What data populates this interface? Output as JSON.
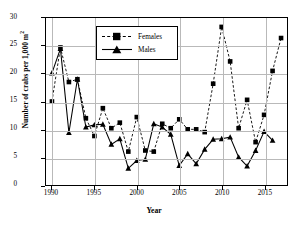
{
  "chart_data": {
    "type": "line",
    "title": "",
    "xlabel": "Year",
    "ylabel": "Number of crabs per 1,000 m²",
    "xlim": [
      1989.3,
      2017.7
    ],
    "ylim": [
      0,
      30
    ],
    "xticks": [
      1990,
      1995,
      2000,
      2005,
      2010,
      2015
    ],
    "yticks": [
      0,
      5,
      10,
      15,
      20,
      25,
      30
    ],
    "grid": true,
    "legend_position": "upper-center-left",
    "x": [
      1990,
      1991,
      1992,
      1993,
      1994,
      1995,
      1996,
      1997,
      1998,
      1999,
      2000,
      2001,
      2002,
      2003,
      2004,
      2005,
      2006,
      2007,
      2008,
      2009,
      2010,
      2011,
      2012,
      2013,
      2014,
      2015,
      2016,
      2017
    ],
    "series": [
      {
        "name": "Females",
        "marker": "square",
        "line_style": "dashed",
        "color": "#000000",
        "values": [
          15.0,
          24.7,
          18.5,
          19.0,
          12.0,
          8.8,
          13.8,
          10.2,
          11.2,
          6.0,
          12.2,
          6.2,
          6.0,
          11.0,
          10.2,
          11.8,
          10.0,
          10.0,
          9.5,
          18.2,
          28.4,
          22.2,
          10.2,
          15.3,
          7.7,
          12.6,
          20.5,
          26.4
        ]
      },
      {
        "name": "Males",
        "marker": "triangle",
        "line_style": "solid",
        "color": "#000000",
        "values": [
          20.1,
          24.5,
          9.4,
          19.0,
          10.4,
          10.8,
          10.9,
          7.3,
          8.3,
          3.0,
          4.4,
          4.6,
          11.0,
          10.4,
          9.1,
          3.5,
          5.6,
          3.8,
          6.4,
          8.2,
          8.3,
          8.6,
          5.0,
          3.4,
          6.2,
          9.6,
          8.0,
          null
        ]
      }
    ]
  },
  "axis": {
    "ytick_labels": [
      "30",
      "25",
      "20",
      "15",
      "10",
      "5",
      "0"
    ],
    "xtick_labels": [
      "1990",
      "1995",
      "2000",
      "2005",
      "2010",
      "2015"
    ],
    "ytitle_main": "Number of crabs per 1,000 m",
    "ytitle_sup": "2",
    "xtitle": "Year"
  },
  "legend": {
    "items": [
      {
        "label": "Females"
      },
      {
        "label": "Males"
      }
    ]
  }
}
